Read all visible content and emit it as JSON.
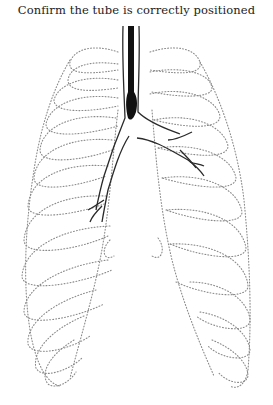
{
  "title": "Confirm the tube is correctly positioned",
  "illustration": {
    "subject": "chest-diagram",
    "elements": [
      "rib-cage-outline",
      "trachea",
      "bronchi",
      "endotracheal-tube"
    ],
    "colors": {
      "ribs": "#8a8a8a",
      "airway": "#2a2a2a",
      "tube": "#111111",
      "background": "#ffffff"
    }
  }
}
